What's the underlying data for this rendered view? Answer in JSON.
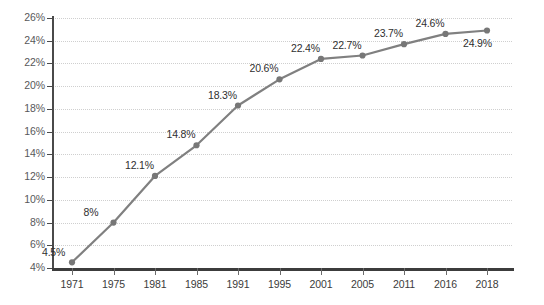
{
  "chart_data": {
    "type": "line",
    "title": "",
    "subtitle": "",
    "xlabel": "",
    "ylabel": "",
    "categories": [
      "1971",
      "1975",
      "1981",
      "1985",
      "1991",
      "1995",
      "2001",
      "2005",
      "2011",
      "2016",
      "2018"
    ],
    "values": [
      4.5,
      8.0,
      12.1,
      14.8,
      18.3,
      20.6,
      22.4,
      22.7,
      23.7,
      24.6,
      24.9
    ],
    "point_labels": [
      "4.5%",
      "8%",
      "12.1%",
      "14.8%",
      "18.3%",
      "20.6%",
      "22.4%",
      "22.7%",
      "23.7%",
      "24.6%",
      "24.9%"
    ],
    "ylim": [
      4,
      26
    ],
    "ytick_values": [
      4,
      6,
      8,
      10,
      12,
      14,
      16,
      18,
      20,
      22,
      24,
      26
    ],
    "ytick_labels": [
      "4%",
      "6%",
      "8%",
      "10%",
      "12%",
      "14%",
      "16%",
      "18%",
      "20%",
      "22%",
      "24%",
      "26%"
    ],
    "grid": true,
    "grid_axis": "y",
    "legend": false,
    "legend_position": "none",
    "series_color": "#808080",
    "marker_color": "#777777",
    "gridline_color": "#cfcfcf",
    "axis_color": "#3c3c3c",
    "tick_label_color": "#58585a",
    "background_color": "#ffffff",
    "marker": "circle",
    "annotations": []
  }
}
